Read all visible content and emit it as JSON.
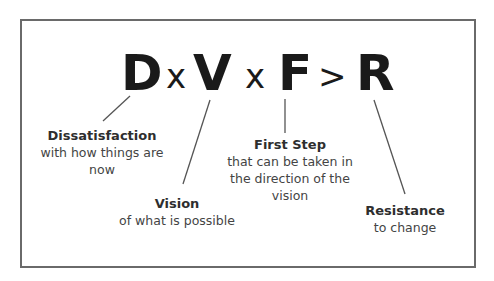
{
  "diagram": {
    "formula": {
      "terms": [
        {
          "id": "D",
          "symbol": "D"
        },
        {
          "id": "op1",
          "symbol": "x"
        },
        {
          "id": "V",
          "symbol": "V"
        },
        {
          "id": "op2",
          "symbol": "x"
        },
        {
          "id": "F",
          "symbol": "F"
        },
        {
          "id": "op3",
          "symbol": ">"
        },
        {
          "id": "R",
          "symbol": "R"
        }
      ]
    },
    "labels": {
      "dissatisfaction": {
        "heading": "Dissatisfaction",
        "body": "with how things are\nnow"
      },
      "vision": {
        "heading": "Vision",
        "body": "of what is possible"
      },
      "first_step": {
        "heading": "First Step",
        "body": "that can be taken in\nthe direction of the\nvision"
      },
      "resistance": {
        "heading": "Resistance",
        "body": "to change"
      }
    },
    "colors": {
      "border": "#6a6a6a",
      "formula_text": "#1a1a1a",
      "label_heading": "#2e2e2e",
      "label_body": "#444444",
      "connector": "#555555",
      "background": "#ffffff"
    }
  }
}
